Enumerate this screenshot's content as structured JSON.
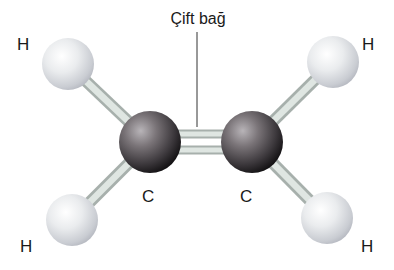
{
  "diagram": {
    "callout": {
      "label": "Çift bağ",
      "x": 198,
      "y": 11,
      "line": {
        "x": 197,
        "y1": 32,
        "y2": 127
      }
    },
    "atoms": [
      {
        "id": "H1",
        "element": "H",
        "cx": 68,
        "cy": 64,
        "r": 26,
        "label": "H",
        "label_x": 17,
        "label_y": 36
      },
      {
        "id": "H2",
        "element": "H",
        "cx": 333,
        "cy": 62,
        "r": 26,
        "label": "H",
        "label_x": 362,
        "label_y": 36
      },
      {
        "id": "H3",
        "element": "H",
        "cx": 72,
        "cy": 220,
        "r": 26,
        "label": "H",
        "label_x": 20,
        "label_y": 238
      },
      {
        "id": "H4",
        "element": "H",
        "cx": 327,
        "cy": 218,
        "r": 26,
        "label": "H",
        "label_x": 361,
        "label_y": 238
      },
      {
        "id": "C1",
        "element": "C",
        "cx": 150,
        "cy": 142,
        "r": 31,
        "label": "C",
        "label_x": 142,
        "label_y": 188
      },
      {
        "id": "C2",
        "element": "C",
        "cx": 252,
        "cy": 142,
        "r": 31,
        "label": "C",
        "label_x": 240,
        "label_y": 188
      }
    ],
    "bonds": [
      {
        "from": "C1",
        "to": "C2",
        "type": "double"
      },
      {
        "from": "C1",
        "to": "H1",
        "type": "single"
      },
      {
        "from": "C1",
        "to": "H3",
        "type": "single"
      },
      {
        "from": "C2",
        "to": "H2",
        "type": "single"
      },
      {
        "from": "C2",
        "to": "H4",
        "type": "single"
      }
    ],
    "colors": {
      "hydrogen": "#e4e6e8",
      "carbon": "#5e5a5e",
      "bond": "#c6d0cc",
      "text": "#1a1a1a",
      "background": "#ffffff"
    }
  }
}
